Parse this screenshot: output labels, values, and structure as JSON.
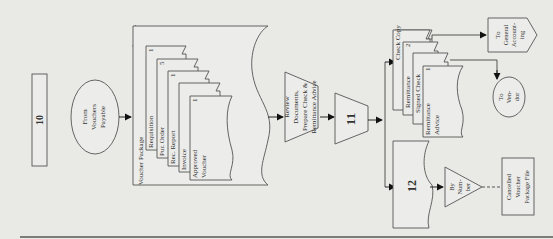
{
  "diagram": {
    "step_box": "10",
    "from_connector": [
      "From",
      "Vouchers",
      "Payable"
    ],
    "voucher_package": {
      "title": "Voucher Package",
      "documents": [
        {
          "label": [
            "Requisition"
          ],
          "copy": "1"
        },
        {
          "label": [
            "Pur. Order"
          ],
          "copy": "5"
        },
        {
          "label": [
            "Rec. Report"
          ],
          "copy": "1"
        },
        {
          "label": [
            "Invoice"
          ],
          "copy": ""
        },
        {
          "label": [
            "Approved",
            "Voucher"
          ],
          "copy": "1"
        }
      ]
    },
    "manual_process": [
      "Review",
      "Documents,",
      "Prepare Check &",
      "Remittance Advice"
    ],
    "process_11": "11",
    "check_docs": [
      {
        "label": [
          "Check Copy"
        ],
        "copy": ""
      },
      {
        "label": [
          "Remittance"
        ],
        "copy": "2"
      },
      {
        "label": [
          "Signed Check"
        ],
        "copy": ""
      },
      {
        "label": [
          "Remittance",
          "Advice"
        ],
        "copy": "1"
      }
    ],
    "to_general_accounting": [
      "To",
      "General",
      "Account-",
      "ing"
    ],
    "to_vendor": [
      "To",
      "Ven-",
      "dor"
    ],
    "doc_12": "12",
    "file_by_number": [
      "By",
      "Num-",
      "ber"
    ],
    "cancelled_file": [
      "Cancelled",
      "Voucher",
      "Package File"
    ]
  }
}
